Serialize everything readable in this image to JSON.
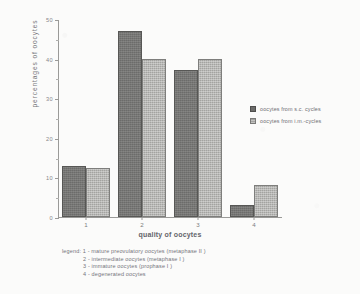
{
  "chart_data": {
    "type": "bar",
    "title": "",
    "xlabel": "quality of oocytes",
    "ylabel": "percentages of oocytes",
    "categories": [
      "1",
      "2",
      "3",
      "4"
    ],
    "ylim": [
      0,
      50
    ],
    "yticks": [
      "0",
      "10",
      "20",
      "30",
      "40",
      "50"
    ],
    "ytick_values": [
      0,
      10,
      20,
      30,
      40,
      50
    ],
    "grid": false,
    "legend_position": "right",
    "series": [
      {
        "name": "oocytes from s.c. cycles",
        "color": "#6c6c6a",
        "values": [
          13,
          47,
          37,
          3
        ]
      },
      {
        "name": "oocytes from i.m.-cycles",
        "color": "#a3a3a0",
        "values": [
          12.5,
          40,
          40,
          8
        ]
      }
    ],
    "annotations": [
      "legend: 1 - mature preovulatory oocytes (metaphase II )",
      "2 - intermediate oocytes (metaphase I )",
      "3 - immature oocytes (prophase I )",
      "4 - degenerated oocytes"
    ]
  },
  "axes": {
    "y_title": "percentages of oocytes",
    "x_title": "quality of oocytes"
  },
  "legend": {
    "entries": [
      {
        "label": "oocytes from s.c. cycles"
      },
      {
        "label": "oocytes from i.m.-cycles"
      }
    ]
  },
  "footnote": {
    "lines": [
      "legend: 1 - mature preovulatory oocytes (metaphase II )",
      "2 - intermediate oocytes (metaphase I )",
      "3 - immature oocytes (prophase I )",
      "4 - degenerated oocytes"
    ]
  }
}
